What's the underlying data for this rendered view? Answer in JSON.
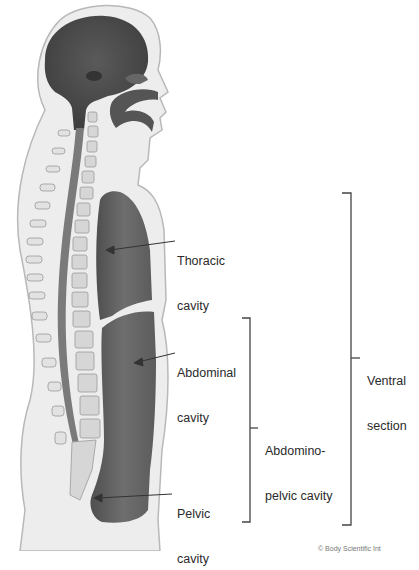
{
  "figure": {
    "colors": {
      "background": "#ffffff",
      "skin_outline": "#bdbdbd",
      "tissue": "#ececec",
      "cavity": "#6b6b6b",
      "cavity_dark": "#555555",
      "leader_line": "#333333",
      "bracket": "#444444",
      "text": "#2a2a2a"
    }
  },
  "labels": {
    "thoracic": {
      "line1": "Thoracic",
      "line2": "cavity"
    },
    "abdominal": {
      "line1": "Abdominal",
      "line2": "cavity"
    },
    "pelvic": {
      "line1": "Pelvic",
      "line2": "cavity"
    },
    "abdominopelvic": {
      "line1": "Abdomino-",
      "line2": "pelvic cavity"
    },
    "ventral": {
      "line1": "Ventral",
      "line2": "section"
    }
  },
  "brackets": {
    "abdominopelvic": {
      "x": 250,
      "top": 318,
      "bottom": 522,
      "tick_y": 428
    },
    "ventral": {
      "x": 351,
      "top": 193,
      "bottom": 525,
      "tick_y": 358
    }
  },
  "credit": "© Body Scientific Int"
}
